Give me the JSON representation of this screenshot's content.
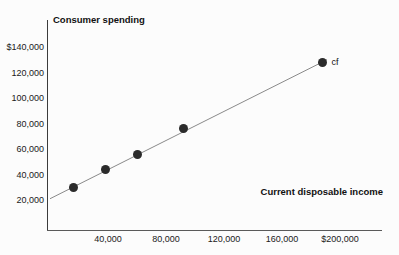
{
  "chart_data": {
    "type": "scatter",
    "title": "",
    "xlabel": "Current disposable income",
    "ylabel": "Consumer spending",
    "xlim": [
      0,
      200000
    ],
    "ylim": [
      0,
      150000
    ],
    "grid": false,
    "legend_position": "inline-right",
    "x_ticks": [
      {
        "value": 40000,
        "label": "40,000"
      },
      {
        "value": 80000,
        "label": "80,000"
      },
      {
        "value": 120000,
        "label": "120,000"
      },
      {
        "value": 160000,
        "label": "160,000"
      },
      {
        "value": 200000,
        "label": "$200,000"
      }
    ],
    "y_ticks": [
      {
        "value": 20000,
        "label": "20,000"
      },
      {
        "value": 40000,
        "label": "40,000"
      },
      {
        "value": 60000,
        "label": "60,000"
      },
      {
        "value": 80000,
        "label": "80,000"
      },
      {
        "value": 100000,
        "label": "100,000"
      },
      {
        "value": 120000,
        "label": "120,000"
      },
      {
        "value": 140000,
        "label": "$140,000"
      }
    ],
    "series": [
      {
        "name": "cf",
        "annotation": "cf",
        "points": [
          {
            "x": 16000,
            "y": 30000
          },
          {
            "x": 38000,
            "y": 44000
          },
          {
            "x": 60000,
            "y": 56000
          },
          {
            "x": 92000,
            "y": 76000
          },
          {
            "x": 188000,
            "y": 128000
          }
        ],
        "fit_line": {
          "from": {
            "x": 0,
            "y": 21000
          },
          "to": {
            "x": 191000,
            "y": 130000
          }
        }
      }
    ],
    "colors": {
      "marker": "#2b2b2b",
      "line": "#8a8a8a",
      "axis": "#3c3c3c",
      "text": "#111111",
      "background": "#fcfcfc"
    }
  }
}
